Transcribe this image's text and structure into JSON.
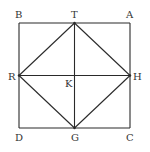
{
  "diagram": {
    "type": "geometry",
    "points": [
      {
        "id": "B",
        "label": "B"
      },
      {
        "id": "T",
        "label": "T"
      },
      {
        "id": "A",
        "label": "A"
      },
      {
        "id": "R",
        "label": "R"
      },
      {
        "id": "K",
        "label": "K"
      },
      {
        "id": "H",
        "label": "H"
      },
      {
        "id": "D",
        "label": "D"
      },
      {
        "id": "G",
        "label": "G"
      },
      {
        "id": "C",
        "label": "C"
      }
    ],
    "segments": [
      [
        "B",
        "A"
      ],
      [
        "A",
        "C"
      ],
      [
        "C",
        "D"
      ],
      [
        "D",
        "B"
      ],
      [
        "T",
        "H"
      ],
      [
        "H",
        "G"
      ],
      [
        "G",
        "R"
      ],
      [
        "R",
        "T"
      ],
      [
        "T",
        "G"
      ],
      [
        "R",
        "H"
      ]
    ],
    "colors": {
      "line": "#2a2a2a",
      "label": "#333333",
      "background": "#ffffff"
    }
  }
}
